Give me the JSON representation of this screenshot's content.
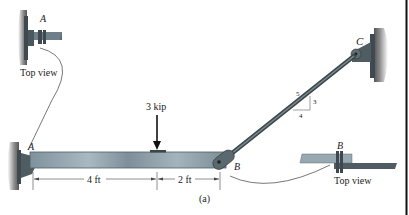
{
  "figure": {
    "caption": "(a)",
    "points": {
      "A": "A",
      "B": "B",
      "C": "C"
    },
    "load": {
      "label": "3 kip",
      "magnitude": 3,
      "unit": "kip"
    },
    "dimensions": [
      {
        "label": "4 ft",
        "value": 4,
        "unit": "ft"
      },
      {
        "label": "2 ft",
        "value": 2,
        "unit": "ft"
      }
    ],
    "slope_triangle": {
      "hyp": "5",
      "rise": "3",
      "run": "4"
    },
    "insets": [
      {
        "point": "A",
        "label": "Top view"
      },
      {
        "point": "B",
        "label": "Top view"
      }
    ]
  },
  "colors": {
    "beam": "#8fa1ab",
    "beam_dark": "#5b6c75",
    "rod": "#4f5d63",
    "wall": "#6d6d6d",
    "text": "#222222"
  }
}
